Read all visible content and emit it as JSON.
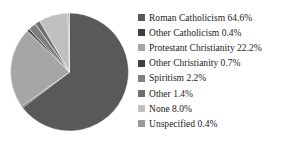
{
  "chart_data": {
    "type": "pie",
    "title": "",
    "xlabel": "",
    "ylabel": "",
    "start_angle_deg": 0,
    "direction": "clockwise",
    "legend_position": "right",
    "grid": false,
    "unit": "%",
    "categories": [
      "Roman Catholicism",
      "Other Catholicism",
      "Protestant Christianity",
      "Other Christianity",
      "Spiritism",
      "Other",
      "None",
      "Unspecified"
    ],
    "values": [
      64.6,
      0.4,
      22.2,
      0.7,
      2.2,
      1.4,
      8.0,
      0.4
    ],
    "colors": [
      "#595959",
      "#3f3f3f",
      "#a6a6a6",
      "#404040",
      "#7f7f7f",
      "#6e6e6e",
      "#bfbfbf",
      "#9a9a9a"
    ],
    "legend_entries": [
      {
        "label": "Roman Catholicism 64.6%",
        "name": "Roman Catholicism",
        "value": 64.6,
        "color": "#595959"
      },
      {
        "label": "Other Catholicism 0.4%",
        "name": "Other Catholicism",
        "value": 0.4,
        "color": "#3f3f3f"
      },
      {
        "label": "Protestant Christianity  22.2%",
        "name": "Protestant Christianity",
        "value": 22.2,
        "color": "#a6a6a6"
      },
      {
        "label": "Other Christianity 0.7%",
        "name": "Other Christianity",
        "value": 0.7,
        "color": "#404040"
      },
      {
        "label": "Spiritism 2.2%",
        "name": "Spiritism",
        "value": 2.2,
        "color": "#7f7f7f"
      },
      {
        "label": "Other 1.4%",
        "name": "Other",
        "value": 1.4,
        "color": "#6e6e6e"
      },
      {
        "label": "None 8.0%",
        "name": "None",
        "value": 8.0,
        "color": "#bfbfbf"
      },
      {
        "label": "Unspecified 0.4%",
        "name": "Unspecified",
        "value": 0.4,
        "color": "#9a9a9a"
      }
    ]
  },
  "pie": {
    "center_x": 59.5,
    "center_y": 60,
    "radius": 59
  }
}
